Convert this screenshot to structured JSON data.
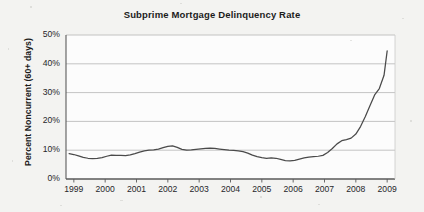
{
  "chart_data": {
    "type": "line",
    "title": "Subprime Mortgage Delinquency Rate",
    "xlabel": "",
    "ylabel": "Percent Noncurrent (60+ days)",
    "xlim": [
      1998.75,
      2009.25
    ],
    "ylim": [
      0,
      50
    ],
    "grid": true,
    "legend": null,
    "xtick_labels": [
      "1999",
      "2000",
      "2001",
      "2002",
      "2003",
      "2004",
      "2005",
      "2006",
      "2007",
      "2008",
      "2009"
    ],
    "xtick_values": [
      1999,
      2000,
      2001,
      2002,
      2003,
      2004,
      2005,
      2006,
      2007,
      2008,
      2009
    ],
    "ytick_labels": [
      "0%",
      "10%",
      "20%",
      "30%",
      "40%",
      "50%"
    ],
    "ytick_values": [
      0,
      10,
      20,
      30,
      40,
      50
    ],
    "series": [
      {
        "name": "Percent Noncurrent (60+ days)",
        "color": "#4a4a4a",
        "x": [
          1998.85,
          1999.0,
          1999.15,
          1999.3,
          1999.45,
          1999.6,
          1999.75,
          1999.9,
          2000.05,
          2000.2,
          2000.35,
          2000.5,
          2000.65,
          2000.8,
          2000.95,
          2001.1,
          2001.25,
          2001.4,
          2001.55,
          2001.7,
          2001.85,
          2002.0,
          2002.15,
          2002.3,
          2002.45,
          2002.6,
          2002.75,
          2002.9,
          2003.05,
          2003.2,
          2003.35,
          2003.5,
          2003.65,
          2003.8,
          2003.95,
          2004.1,
          2004.25,
          2004.4,
          2004.55,
          2004.7,
          2004.85,
          2005.0,
          2005.15,
          2005.3,
          2005.45,
          2005.6,
          2005.75,
          2005.9,
          2006.05,
          2006.2,
          2006.35,
          2006.5,
          2006.65,
          2006.8,
          2006.95,
          2007.1,
          2007.25,
          2007.4,
          2007.55,
          2007.7,
          2007.85,
          2008.0,
          2008.15,
          2008.3,
          2008.45,
          2008.6,
          2008.75,
          2008.9,
          2009.0
        ],
        "y": [
          8.8,
          8.5,
          8.0,
          7.5,
          7.2,
          7.1,
          7.2,
          7.4,
          7.9,
          8.3,
          8.2,
          8.2,
          8.1,
          8.4,
          8.8,
          9.3,
          9.8,
          10.0,
          10.1,
          10.4,
          10.9,
          11.3,
          11.5,
          11.0,
          10.3,
          10.0,
          10.1,
          10.3,
          10.5,
          10.6,
          10.7,
          10.6,
          10.4,
          10.2,
          10.0,
          9.9,
          9.8,
          9.5,
          9.0,
          8.3,
          7.8,
          7.4,
          7.2,
          7.3,
          7.2,
          6.8,
          6.4,
          6.3,
          6.5,
          6.9,
          7.3,
          7.6,
          7.8,
          7.9,
          8.2,
          9.2,
          10.6,
          12.2,
          13.3,
          13.7,
          14.2,
          15.6,
          18.2,
          21.6,
          25.4,
          29.2,
          31.4,
          36.0,
          44.5
        ]
      }
    ]
  },
  "figure": {
    "background_color": "#f3f3f1",
    "plot_background_color": "#fcfcfc",
    "grid_color": "#b5b5b5",
    "axis_color": "#5a5a5a",
    "line_color": "#4a4a4a",
    "text_color": "#1c1c1c"
  }
}
